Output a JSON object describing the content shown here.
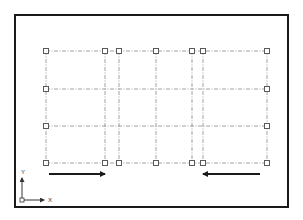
{
  "diagram": {
    "type": "structural-grid-plan",
    "frame": {
      "x": 15,
      "y": 15,
      "width": 273,
      "height": 192,
      "stroke": "#1a1a1a"
    },
    "grid": {
      "line_color": "#8a8a8a",
      "node_color": "#5a5a5a",
      "columns_x": [
        46,
        105,
        119,
        156,
        192,
        203,
        267
      ],
      "rows_y": [
        51,
        89,
        126,
        163
      ],
      "nodes": [
        {
          "x": 46,
          "y": 51
        },
        {
          "x": 105,
          "y": 51
        },
        {
          "x": 119,
          "y": 51
        },
        {
          "x": 156,
          "y": 51
        },
        {
          "x": 192,
          "y": 51
        },
        {
          "x": 203,
          "y": 51
        },
        {
          "x": 267,
          "y": 51
        },
        {
          "x": 46,
          "y": 89
        },
        {
          "x": 267,
          "y": 89
        },
        {
          "x": 46,
          "y": 126
        },
        {
          "x": 267,
          "y": 126
        },
        {
          "x": 46,
          "y": 163
        },
        {
          "x": 105,
          "y": 163
        },
        {
          "x": 119,
          "y": 163
        },
        {
          "x": 156,
          "y": 163
        },
        {
          "x": 192,
          "y": 163
        },
        {
          "x": 203,
          "y": 163
        },
        {
          "x": 267,
          "y": 163
        }
      ]
    },
    "arrows": [
      {
        "name": "load-arrow-right",
        "x1": 49,
        "y1": 174,
        "x2": 105,
        "y2": 174,
        "direction": "right"
      },
      {
        "name": "load-arrow-left",
        "x1": 260,
        "y1": 174,
        "x2": 203,
        "y2": 174,
        "direction": "left"
      }
    ],
    "arrow_color": "#1a1a1a",
    "ucs": {
      "origin": {
        "x": 22,
        "y": 200
      },
      "x_label": "X",
      "y_label": "Y"
    }
  }
}
